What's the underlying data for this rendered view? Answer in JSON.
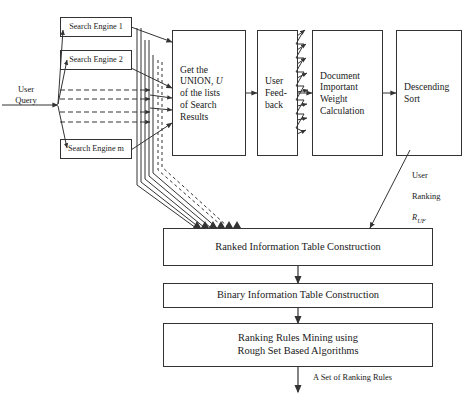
{
  "diagram": {
    "colors": {
      "background": "#ffffff",
      "stroke": "#333333",
      "text": "#1a1a1a"
    },
    "sources": [
      {
        "id": "se1",
        "label": "Search Engine 1"
      },
      {
        "id": "se2",
        "label": "Search Engine 2"
      },
      {
        "id": "sem",
        "label": "Search Engine m"
      }
    ],
    "pipeline": [
      {
        "id": "union",
        "label": "Get the\nUNION, U\nof the lists\nof Search\nResults",
        "emphasis": "U"
      },
      {
        "id": "feedback",
        "label": "User\nFeed-\nback"
      },
      {
        "id": "weight",
        "label": "Document\nImportant\nWeight\nCalculation"
      },
      {
        "id": "sort",
        "label": "Descending\nSort"
      }
    ],
    "stages": [
      {
        "id": "ranked-table",
        "label": "Ranked Information Table Construction"
      },
      {
        "id": "binary-table",
        "label": "Binary Information Table Construction"
      },
      {
        "id": "rules-mining",
        "label": "Ranking Rules Mining using\nRough Set Based Algorithms"
      }
    ],
    "labels": {
      "user_query": "User\nQuery",
      "user_ranking_line1": "User",
      "user_ranking_line2": "Ranking",
      "user_ranking_symbol": "R",
      "user_ranking_subscript": "UF",
      "output": "A Set of Ranking Rules"
    }
  }
}
